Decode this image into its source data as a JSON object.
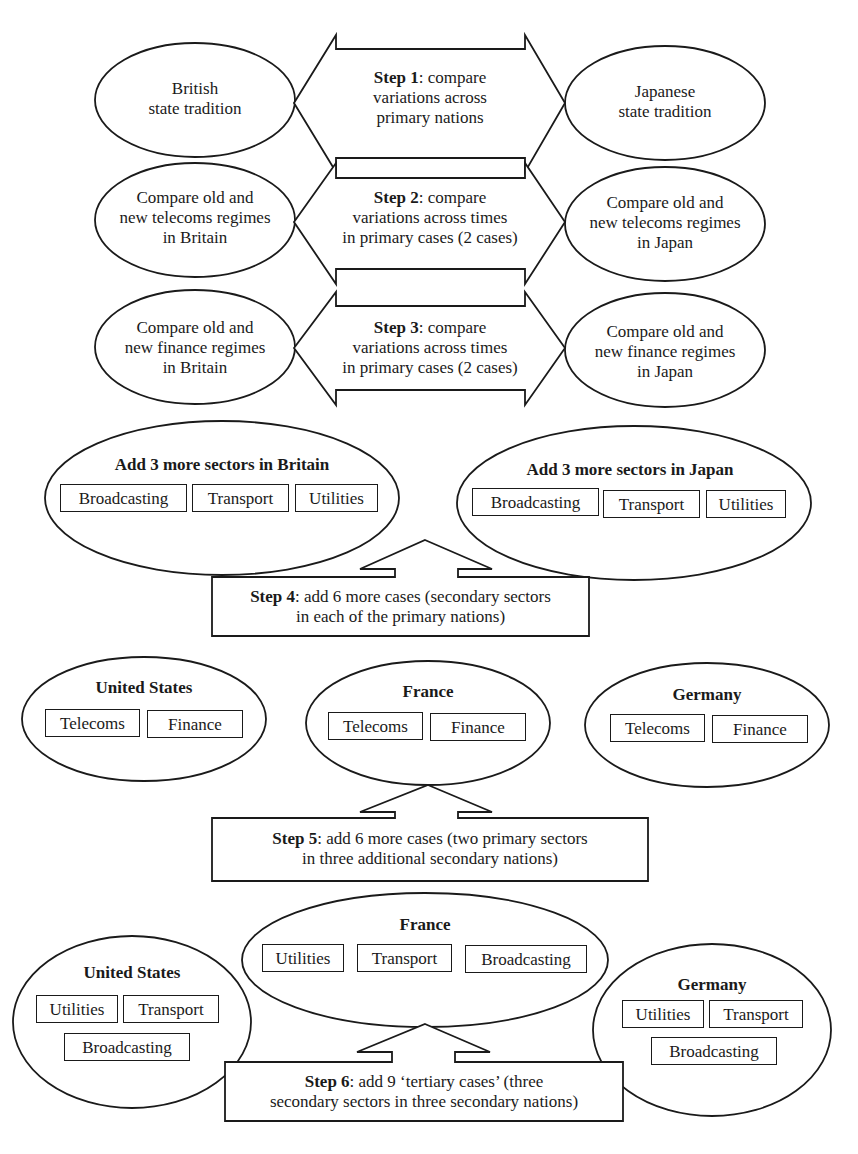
{
  "colors": {
    "line": "#1a1a1a",
    "background": "#ffffff"
  },
  "row1": {
    "left": {
      "line1": "British",
      "line2": "state tradition"
    },
    "arrow": {
      "step": "Step 1",
      "text1": ": compare",
      "text2": "variations across",
      "text3": "primary nations"
    },
    "right": {
      "line1": "Japanese",
      "line2": "state tradition"
    }
  },
  "row2": {
    "left": {
      "line1": "Compare old and",
      "line2": "new telecoms regimes",
      "line3": "in Britain"
    },
    "arrow": {
      "step": "Step 2",
      "text1": ": compare",
      "text2": "variations across times",
      "text3": "in primary cases (2 cases)"
    },
    "right": {
      "line1": "Compare old and",
      "line2": "new telecoms regimes",
      "line3": "in Japan"
    }
  },
  "row3": {
    "left": {
      "line1": "Compare old and",
      "line2": "new finance regimes",
      "line3": "in Britain"
    },
    "arrow": {
      "step": "Step 3",
      "text1": ": compare",
      "text2": "variations across times",
      "text3": "in primary cases (2 cases)"
    },
    "right": {
      "line1": "Compare old and",
      "line2": "new finance regimes",
      "line3": "in Japan"
    }
  },
  "row4": {
    "britain": {
      "title": "Add 3 more sectors in Britain",
      "sectors": [
        "Broadcasting",
        "Transport",
        "Utilities"
      ]
    },
    "japan": {
      "title": "Add 3 more sectors in Japan",
      "sectors": [
        "Broadcasting",
        "Transport",
        "Utilities"
      ]
    },
    "step": {
      "label": "Step 4",
      "text1": ": add 6 more cases (secondary sectors",
      "text2": "in each of the primary nations)"
    }
  },
  "row5": {
    "nations": [
      {
        "title": "United States",
        "sectors": [
          "Telecoms",
          "Finance"
        ]
      },
      {
        "title": "France",
        "sectors": [
          "Telecoms",
          "Finance"
        ]
      },
      {
        "title": "Germany",
        "sectors": [
          "Telecoms",
          "Finance"
        ]
      }
    ],
    "step": {
      "label": "Step 5",
      "text1": ": add 6 more cases (two primary sectors",
      "text2": "in three additional secondary nations)"
    }
  },
  "row6": {
    "nations": [
      {
        "title": "United States",
        "sectors": [
          "Utilities",
          "Transport",
          "Broadcasting"
        ]
      },
      {
        "title": "France",
        "sectors": [
          "Utilities",
          "Transport",
          "Broadcasting"
        ]
      },
      {
        "title": "Germany",
        "sectors": [
          "Utilities",
          "Transport",
          "Broadcasting"
        ]
      }
    ],
    "step": {
      "label": "Step 6",
      "text1": ": add 9 ‘tertiary cases’ (three",
      "text2": "secondary sectors in three secondary nations)"
    }
  }
}
